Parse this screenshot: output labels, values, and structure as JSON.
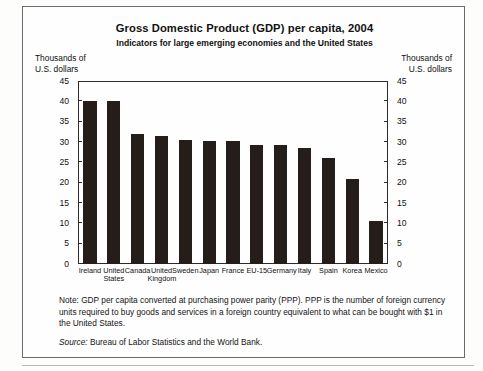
{
  "chart_data": {
    "type": "bar",
    "title": "Gross Domestic Product (GDP) per capita, 2004",
    "subtitle": "Indicators for large emerging economies and the United States",
    "ylabel": "Thousands of U.S. dollars",
    "ylabel_left_line1": "Thousands of",
    "ylabel_left_line2": "U.S. dollars",
    "ylabel_right_line1": "Thousands of",
    "ylabel_right_line2": "U.S. dollars",
    "xlabel": "",
    "ylim": [
      0,
      45
    ],
    "ytick_step": 5,
    "yticks": [
      0,
      5,
      10,
      15,
      20,
      25,
      30,
      35,
      40,
      45
    ],
    "ytick_labels": [
      "0",
      "5",
      "10",
      "15",
      "20",
      "25",
      "30",
      "35",
      "40",
      "45"
    ],
    "grid": false,
    "legend": "none",
    "bar_color": "#241d1a",
    "categories": [
      "Ireland",
      "United States",
      "Canada",
      "United Kingdom",
      "Sweden",
      "Japan",
      "France",
      "EU-15",
      "Germany",
      "Italy",
      "Spain",
      "Korea",
      "Mexico"
    ],
    "category_labels": [
      [
        "Ireland"
      ],
      [
        "United",
        "States"
      ],
      [
        "Canada"
      ],
      [
        "United",
        "Kingdom"
      ],
      [
        "Sweden"
      ],
      [
        "Japan"
      ],
      [
        "France"
      ],
      [
        "EU-15"
      ],
      [
        "Germany"
      ],
      [
        "Italy"
      ],
      [
        "Spain"
      ],
      [
        "Korea"
      ],
      [
        "Mexico"
      ]
    ],
    "values": [
      40.2,
      40.2,
      32.0,
      31.5,
      30.5,
      30.2,
      30.2,
      29.2,
      29.2,
      28.5,
      26.0,
      21.0,
      10.5
    ]
  },
  "notes": {
    "note_text": "Note:  GDP per capita converted at purchasing power parity (PPP). PPP is the number of foreign currency units required to buy goods and services in a foreign country equivalent to what can be bought with $1 in the United States.",
    "source_label": "Source:",
    "source_text": "Bureau of Labor Statistics and the World Bank."
  }
}
